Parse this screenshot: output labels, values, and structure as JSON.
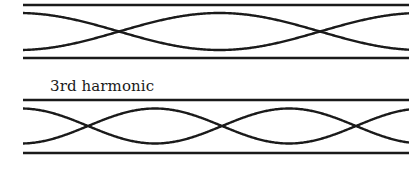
{
  "colors": {
    "stroke": "#1a1a1a",
    "background": "#ffffff"
  },
  "diagrams": [
    {
      "name": "upper-standing-wave",
      "label": "",
      "x_start": 23,
      "x_end": 409,
      "tube_top_y": 5,
      "tube_bottom_y": 58,
      "center_y": 31.5,
      "amplitude": 18.5,
      "node_x": [
        119,
        320
      ],
      "node_spacing": 201
    },
    {
      "name": "lower-standing-wave",
      "label": "3rd harmonic",
      "x_start": 23,
      "x_end": 409,
      "tube_top_y": 100,
      "tube_bottom_y": 153,
      "center_y": 126,
      "amplitude": 17.5,
      "node_x": [
        88,
        217,
        356
      ],
      "node_spacing": 134
    }
  ],
  "caption": {
    "text": "3rd harmonic"
  }
}
